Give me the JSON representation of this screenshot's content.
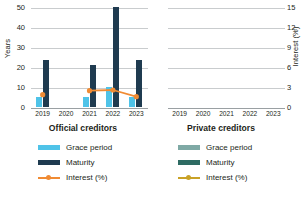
{
  "chart_data": {
    "type": "bar",
    "title": "",
    "categories": [
      "2019",
      "2020",
      "2021",
      "2022",
      "2023"
    ],
    "panels": [
      {
        "name": "Official creditors",
        "series": [
          {
            "name": "Grace period",
            "axis": "left",
            "type": "bar",
            "color": "#4FC3E8",
            "values": [
              5,
              null,
              5,
              10,
              5
            ]
          },
          {
            "name": "Maturity",
            "axis": "left",
            "type": "bar",
            "color": "#1F3B50",
            "values": [
              23.5,
              null,
              21,
              50,
              23.5
            ]
          },
          {
            "name": "Interest (%)",
            "axis": "right",
            "type": "line",
            "color": "#F08B33",
            "values": [
              2.0,
              null,
              2.6,
              2.7,
              1.7
            ]
          }
        ]
      },
      {
        "name": "Private creditors",
        "series": [
          {
            "name": "Grace period",
            "axis": "left",
            "type": "bar",
            "color": "#7FA9A5",
            "values": [
              null,
              null,
              null,
              null,
              null
            ]
          },
          {
            "name": "Maturity",
            "axis": "left",
            "type": "bar",
            "color": "#2E6B63",
            "values": [
              null,
              null,
              null,
              null,
              null
            ]
          },
          {
            "name": "Interest (%)",
            "axis": "right",
            "type": "line",
            "color": "#C9A227",
            "values": [
              null,
              null,
              null,
              null,
              null
            ]
          }
        ]
      }
    ],
    "left_axis": {
      "label": "Years",
      "ticks": [
        "0",
        "10",
        "20",
        "30",
        "40",
        "50"
      ],
      "min": 0,
      "max": 50
    },
    "right_axis": {
      "label": "Interest (%)",
      "ticks": [
        "0",
        "3",
        "6",
        "9",
        "12",
        "15"
      ],
      "min": 0,
      "max": 15
    },
    "grid": true,
    "legend_position": "bottom"
  },
  "left_axis_label": "Years",
  "right_axis_label": "Interest (%)",
  "yticks_left": [
    "50",
    "40",
    "30",
    "20",
    "10",
    "0"
  ],
  "yticks_right": [
    "15",
    "12",
    "9",
    "6",
    "3",
    "0"
  ],
  "xlabels": [
    "2019",
    "2020",
    "2021",
    "2022",
    "2023"
  ],
  "panel_titles": {
    "official": "Official creditors",
    "private": "Private creditors"
  },
  "legend": {
    "official": [
      {
        "label": "Grace period",
        "color": "#4FC3E8"
      },
      {
        "label": "Maturity",
        "color": "#1F3B50"
      },
      {
        "label": "Interest (%)",
        "color": "#F08B33"
      }
    ],
    "private": [
      {
        "label": "Grace period",
        "color": "#7FA9A5"
      },
      {
        "label": "Maturity",
        "color": "#2E6B63"
      },
      {
        "label": "Interest (%)",
        "color": "#C9A227"
      }
    ]
  }
}
